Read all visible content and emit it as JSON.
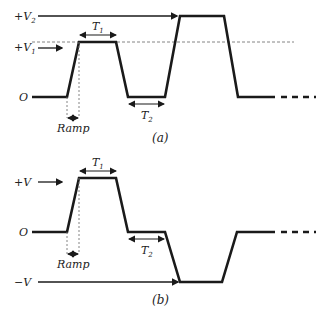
{
  "diagram": {
    "panel_a": {
      "caption": "(a)",
      "level_labels": {
        "v2": "+V",
        "v2_sub": "2",
        "v1": "+V",
        "v1_sub": "1",
        "zero": "O"
      },
      "t1_label": "T",
      "t1_sub": "1",
      "t2_label": "T",
      "t2_sub": "2",
      "ramp_label": "Ramp"
    },
    "panel_b": {
      "caption": "(b)",
      "level_labels": {
        "pos": "+V",
        "zero": "O",
        "neg": "−V"
      },
      "t1_label": "T",
      "t1_sub": "1",
      "t2_label": "T",
      "t2_sub": "2",
      "ramp_label": "Ramp"
    },
    "colors": {
      "stroke": "#1a1a1a",
      "dotted": "#777777"
    }
  }
}
